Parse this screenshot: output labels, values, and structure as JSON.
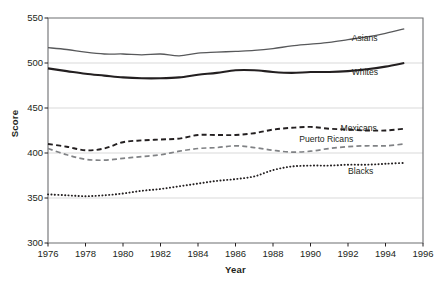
{
  "chart_data": {
    "type": "line",
    "title": "",
    "xlabel": "Year",
    "ylabel": "Score",
    "xlim": [
      1976,
      1996
    ],
    "ylim": [
      300,
      550
    ],
    "ytick_step": 50,
    "xtick_step": 2,
    "grid": "horizontal",
    "legend_position": "inline-right",
    "xticks": [
      "1976",
      "1978",
      "1980",
      "1982",
      "1984",
      "1986",
      "1988",
      "1990",
      "1992",
      "1994",
      "1996"
    ],
    "yticks": [
      "300",
      "350",
      "400",
      "450",
      "500",
      "550"
    ],
    "x": [
      1976,
      1977,
      1978,
      1979,
      1980,
      1981,
      1982,
      1983,
      1984,
      1985,
      1986,
      1987,
      1988,
      1989,
      1990,
      1991,
      1992,
      1993,
      1994,
      1995
    ],
    "series": [
      {
        "name": "Asians",
        "style": "solid",
        "color": "#58595b",
        "width": 1.3,
        "label_x": 1992.2,
        "label_y": 527,
        "values": [
          517,
          515,
          512,
          510,
          510,
          509,
          510,
          508,
          511,
          512,
          513,
          514,
          516,
          519,
          521,
          523,
          526,
          529,
          533,
          538
        ]
      },
      {
        "name": "Whites",
        "style": "solid",
        "color": "#231f20",
        "width": 2.1,
        "label_x": 1992.2,
        "label_y": 489,
        "values": [
          494,
          491,
          488,
          486,
          484,
          483,
          483,
          484,
          487,
          489,
          492,
          492,
          490,
          489,
          490,
          490,
          491,
          493,
          496,
          500
        ]
      },
      {
        "name": "Mexicans",
        "style": "dashed",
        "color": "#231f20",
        "width": 1.9,
        "label_x": 1991.6,
        "label_y": 427,
        "values": [
          410,
          407,
          403,
          405,
          412,
          414,
          415,
          416,
          420,
          420,
          420,
          422,
          426,
          428,
          429,
          427,
          426,
          425,
          425,
          427
        ]
      },
      {
        "name": "Puerto Ricans",
        "style": "dashed",
        "color": "#808285",
        "width": 1.7,
        "label_x": 1989.4,
        "label_y": 414,
        "values": [
          405,
          398,
          393,
          392,
          394,
          396,
          398,
          402,
          405,
          406,
          408,
          406,
          403,
          401,
          402,
          405,
          407,
          408,
          408,
          410
        ]
      },
      {
        "name": "Blacks",
        "style": "dotted",
        "color": "#231f20",
        "width": 1.9,
        "label_x": 1992.0,
        "label_y": 379,
        "values": [
          354,
          353,
          352,
          353,
          355,
          358,
          360,
          363,
          366,
          369,
          371,
          374,
          381,
          385,
          386,
          386,
          387,
          387,
          388,
          389
        ]
      }
    ]
  }
}
